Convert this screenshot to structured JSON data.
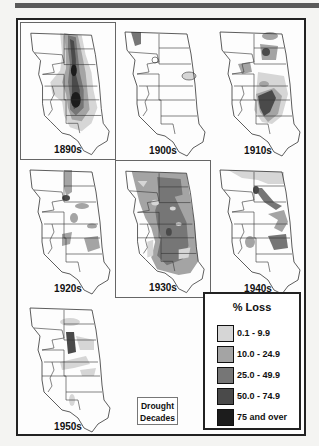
{
  "figure": {
    "caption_box": [
      "Drought",
      "Decades"
    ],
    "panels": [
      {
        "decade": "1890s",
        "boxed": true
      },
      {
        "decade": "1900s",
        "boxed": false
      },
      {
        "decade": "1910s",
        "boxed": false
      },
      {
        "decade": "1920s",
        "boxed": false
      },
      {
        "decade": "1930s",
        "boxed": true
      },
      {
        "decade": "1940s",
        "boxed": false
      },
      {
        "decade": "1950s",
        "boxed": false
      }
    ],
    "drought_decades_highlighted": [
      "1890s",
      "1930s"
    ]
  },
  "legend": {
    "title": "% Loss",
    "items": [
      {
        "label": "0.1 - 9.9",
        "color": "#d6d6d6"
      },
      {
        "label": "10.0 - 24.9",
        "color": "#a4a4a4"
      },
      {
        "label": "25.0 - 49.9",
        "color": "#767676"
      },
      {
        "label": "50.0 - 74.9",
        "color": "#4a4a4a"
      },
      {
        "label": "75 and over",
        "color": "#1c1c1c"
      }
    ]
  },
  "colors": {
    "frame": "#222222",
    "background": "#fdfdfd",
    "top_rule": "#5a5a5a"
  }
}
